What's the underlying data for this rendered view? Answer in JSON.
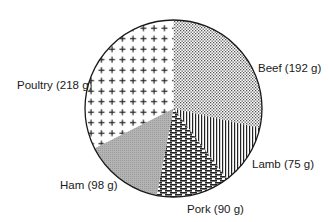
{
  "chart_data": {
    "type": "pie",
    "title": "",
    "unit": "g",
    "start_angle_deg": 0,
    "direction": "clockwise",
    "categories": [
      "Beef",
      "Lamb",
      "Pork",
      "Ham",
      "Poultry"
    ],
    "values": [
      192,
      75,
      90,
      98,
      218
    ],
    "labels": [
      "Beef (192 g)",
      "Lamb (75 g)",
      "Pork (90 g)",
      "Ham (98 g)",
      "Poultry (218 g)"
    ],
    "patterns": [
      "dot-stipple",
      "vertical-lines",
      "horizontal-dashes",
      "fine-gray",
      "plus-signs"
    ],
    "legend": "none (direct labels)",
    "grid": false
  },
  "colors": {
    "ink": "#1a1a1a",
    "background": "#ffffff",
    "ham_gray": "#a9a9a9"
  }
}
